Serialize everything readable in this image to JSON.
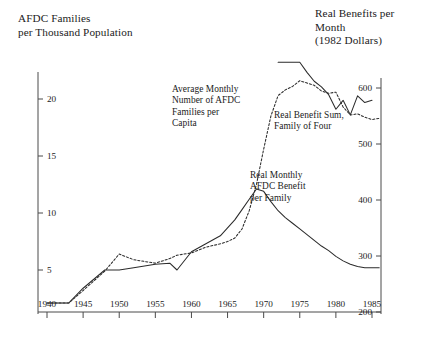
{
  "chart_data": {
    "type": "line",
    "title": "",
    "background": "#ffffff",
    "ink_color": "#2b2b2b",
    "grid": false,
    "legend_position": "inline-annotations",
    "left_axis": {
      "label_line1": "AFDC Families",
      "label_line2": "per Thousand Population",
      "ticks": [
        5,
        10,
        15,
        20
      ],
      "tick_labels": [
        "5",
        "10",
        "15",
        "20"
      ],
      "ylim": [
        0,
        24
      ]
    },
    "right_axis": {
      "label_line1": "Real Benefits per",
      "label_line2": "Month",
      "label_line3": "(1982 Dollars)",
      "ticks": [
        200,
        300,
        400,
        500,
        600
      ],
      "tick_labels": [
        "200",
        "300",
        "400",
        "500",
        "600"
      ],
      "ylim": [
        200,
        640
      ]
    },
    "x_axis": {
      "label": "",
      "ticks": [
        1940,
        1945,
        1950,
        1955,
        1960,
        1965,
        1970,
        1975,
        1980,
        1985
      ],
      "tick_labels": [
        "1940",
        "1945",
        "1950",
        "1955",
        "1960",
        "1965",
        "1970",
        "1975",
        "1980",
        "1985"
      ],
      "xlim": [
        1938,
        1988
      ]
    },
    "annotations": [
      {
        "name": "families-per-capita",
        "text": "Average Monthly\nNumber of AFDC\nFamilies per\nCapita"
      },
      {
        "name": "benefit-sum",
        "text": "Real Benefit Sum,\nFamily of Four"
      },
      {
        "name": "monthly-benefit",
        "text": "Real Monthly\nAFDC Benefit\nper Family"
      }
    ],
    "series": [
      {
        "name": "Average Monthly Number of AFDC Families per Capita",
        "axis": "left",
        "style": "dotted",
        "units": "families per thousand population",
        "x": [
          1940,
          1943,
          1945,
          1948,
          1950,
          1952,
          1955,
          1957,
          1958,
          1960,
          1962,
          1964,
          1965,
          1966,
          1967,
          1968,
          1969,
          1970,
          1971,
          1972,
          1973,
          1974,
          1975,
          1976,
          1977,
          1978,
          1979,
          1980,
          1981,
          1982,
          1983,
          1984,
          1985,
          1986
        ],
        "y": [
          2.1,
          2.1,
          3.2,
          4.9,
          6.4,
          5.9,
          5.6,
          6.0,
          6.3,
          6.5,
          7.0,
          7.3,
          7.5,
          7.8,
          8.6,
          10.2,
          12.5,
          15.6,
          18.5,
          20.3,
          20.8,
          21.1,
          21.6,
          21.4,
          21.2,
          20.7,
          20.5,
          20.6,
          19.3,
          18.6,
          18.7,
          18.4,
          18.2,
          18.3
        ]
      },
      {
        "name": "Real Monthly AFDC Benefit per Family",
        "axis": "left",
        "style": "solid",
        "units": "scaled to left axis",
        "x": [
          1940,
          1943,
          1945,
          1948,
          1950,
          1952,
          1955,
          1957,
          1958,
          1960,
          1962,
          1964,
          1966,
          1967,
          1968,
          1969,
          1970,
          1971,
          1972,
          1973,
          1974,
          1975,
          1976,
          1977,
          1978,
          1979,
          1980,
          1981,
          1982,
          1983,
          1984,
          1985,
          1986
        ],
        "y": [
          2.1,
          2.1,
          3.4,
          5.0,
          5.0,
          5.2,
          5.5,
          5.6,
          5.0,
          6.6,
          7.3,
          8.0,
          9.4,
          10.3,
          11.2,
          12.1,
          11.9,
          11.0,
          10.2,
          9.6,
          9.1,
          8.6,
          8.1,
          7.6,
          7.1,
          6.7,
          6.2,
          5.8,
          5.5,
          5.3,
          5.2,
          5.2,
          5.2
        ]
      },
      {
        "name": "Real Benefit Sum, Family of Four",
        "axis": "right",
        "style": "solid",
        "units": "1982 dollars per month",
        "x": [
          1972,
          1973,
          1974,
          1975,
          1976,
          1977,
          1978,
          1979,
          1980,
          1981,
          1982,
          1983,
          1984,
          1985
        ],
        "y": [
          646,
          646,
          646,
          646,
          628,
          612,
          602,
          588,
          562,
          578,
          552,
          586,
          574,
          578
        ]
      }
    ]
  },
  "left_title": {
    "line1": "AFDC Families",
    "line2": "per Thousand Population"
  },
  "right_title": {
    "line1": "Real Benefits per",
    "line2": "Month",
    "line3": "(1982 Dollars)"
  },
  "annotation_families": {
    "line1": "Average Monthly",
    "line2": "Number of AFDC",
    "line3": "Families per",
    "line4": "Capita"
  },
  "annotation_benefit_sum": {
    "line1": "Real Benefit Sum,",
    "line2": "Family of Four"
  },
  "annotation_monthly": {
    "line1": "Real Monthly",
    "line2": "AFDC Benefit",
    "line3": "per Family"
  }
}
